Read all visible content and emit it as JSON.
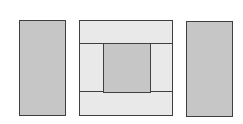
{
  "diagram": {
    "colors": {
      "shaded": "#c6c6c6",
      "light": "#e9e9e9",
      "border": "#3f3f3f",
      "background": "#ffffff"
    },
    "panels": [
      {
        "name": "left-panel",
        "fill": "shaded"
      },
      {
        "name": "center-panel",
        "fill": "light",
        "regions": [
          "top-band",
          "bottom-band",
          "left-strip",
          "right-strip",
          "inner-square"
        ]
      },
      {
        "name": "right-panel",
        "fill": "shaded"
      }
    ]
  }
}
